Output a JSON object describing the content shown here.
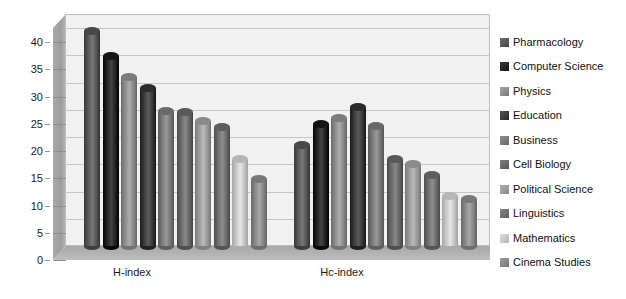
{
  "chart_data": {
    "type": "bar",
    "title": "",
    "subtitle": "",
    "xlabel": "",
    "ylabel": "",
    "categories": [
      "H-index",
      "Hc-index"
    ],
    "ylim": [
      0,
      40
    ],
    "yticks": [
      0,
      5,
      10,
      15,
      20,
      25,
      30,
      35,
      40
    ],
    "grid": true,
    "legend_position": "right",
    "style": "3d-cylinder",
    "series": [
      {
        "name": "Pharmacology",
        "color": "#5a5a5a",
        "values": [
          39.5,
          18.5
        ]
      },
      {
        "name": "Computer Science",
        "color": "#262626",
        "values": [
          34.8,
          22.3
        ]
      },
      {
        "name": "Physics",
        "color": "#8e8e8e",
        "values": [
          31.0,
          23.5
        ]
      },
      {
        "name": "Education",
        "color": "#3d3d3d",
        "values": [
          29.0,
          25.5
        ]
      },
      {
        "name": "Business",
        "color": "#7b7b7b",
        "values": [
          24.8,
          22.0
        ]
      },
      {
        "name": "Cell Biology",
        "color": "#6b6b6b",
        "values": [
          24.5,
          16.0
        ]
      },
      {
        "name": "Political Science",
        "color": "#9c9c9c",
        "values": [
          23.0,
          15.0
        ]
      },
      {
        "name": "Linguistics",
        "color": "#707070",
        "values": [
          21.8,
          13.0
        ]
      },
      {
        "name": "Mathematics",
        "color": "#c8c8c8",
        "values": [
          16.0,
          9.2
        ]
      },
      {
        "name": "Cinema Studies",
        "color": "#8a8a8a",
        "values": [
          12.3,
          8.6
        ]
      }
    ]
  },
  "legend": {
    "items": [
      {
        "label": "Pharmacology"
      },
      {
        "label": "Computer Science"
      },
      {
        "label": "Physics"
      },
      {
        "label": "Education"
      },
      {
        "label": "Business"
      },
      {
        "label": "Cell Biology"
      },
      {
        "label": "Political Science"
      },
      {
        "label": "Linguistics"
      },
      {
        "label": "Mathematics"
      },
      {
        "label": "Cinema Studies"
      }
    ]
  },
  "axis": {
    "y_tick_labels": [
      "40",
      "35",
      "30",
      "25",
      "20",
      "15",
      "10",
      "5",
      "0"
    ],
    "x_tick_labels": [
      "H-index",
      "Hc-index"
    ]
  }
}
